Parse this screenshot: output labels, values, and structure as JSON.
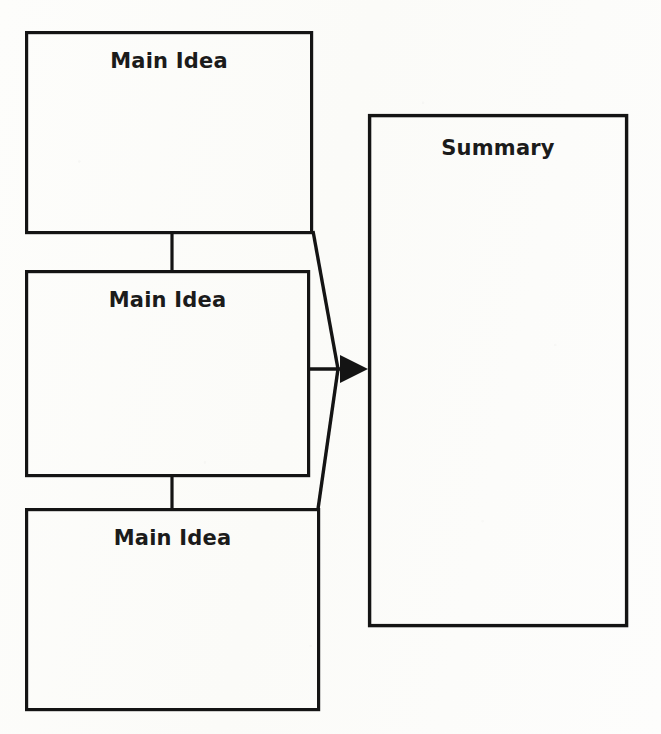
{
  "document": {
    "type": "graphic-organizer",
    "title": "Main Idea and Summary Organizer",
    "background_color": "#fcfcfa",
    "ink_color": "#141414"
  },
  "boxes": [
    {
      "id": "main-idea-1",
      "label": "Main Idea",
      "x": 25,
      "y": 31,
      "width": 288,
      "height": 203
    },
    {
      "id": "main-idea-2",
      "label": "Main Idea",
      "x": 25,
      "y": 270,
      "width": 285,
      "height": 207
    },
    {
      "id": "main-idea-3",
      "label": "Main Idea",
      "x": 25,
      "y": 508,
      "width": 295,
      "height": 203
    }
  ],
  "summary": {
    "id": "summary",
    "label": "Summary",
    "x": 368,
    "y": 114,
    "width": 260,
    "height": 513
  },
  "connectors": {
    "vertical_1_label": "connector between main idea 1 and main idea 2",
    "vertical_2_label": "connector between main idea 2 and main idea 3",
    "arrow_label": "arrow pointing to summary"
  }
}
